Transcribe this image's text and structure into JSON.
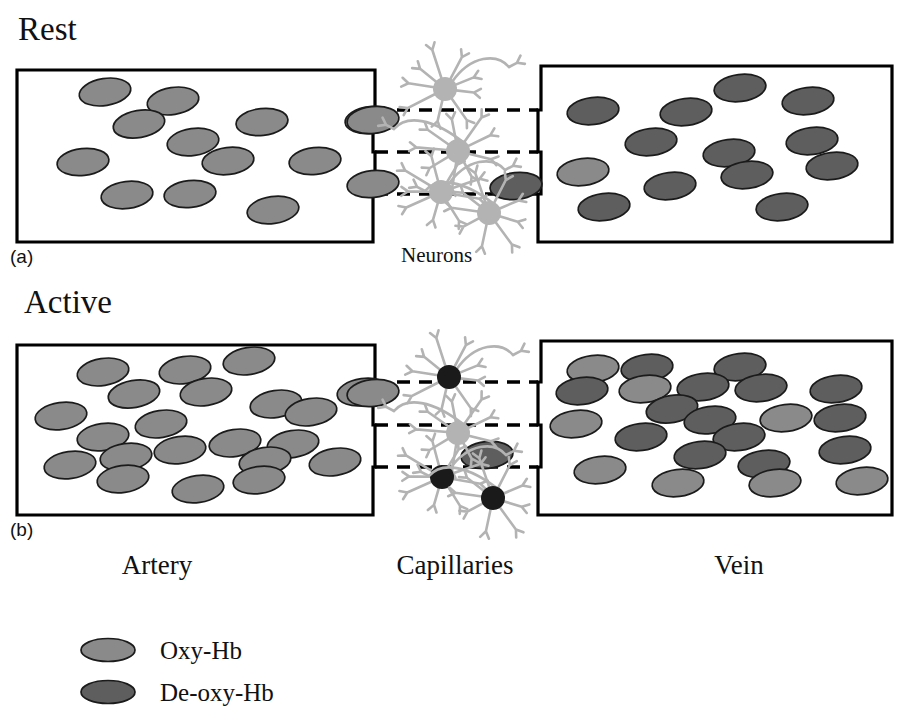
{
  "figure": {
    "title_rest": "Rest",
    "title_active": "Active",
    "sublabel_a": "(a)",
    "sublabel_b": "(b)",
    "neurons_label": "Neurons",
    "column_labels": [
      "Artery",
      "Capillaries",
      "Vein"
    ],
    "colors": {
      "oxy_hb": "#8a8a8a",
      "deoxy_hb": "#5e5e5e",
      "neuron_inactive": "#b3b3b3",
      "neuron_active": "#1a1a1a",
      "vessel_stroke": "#000000",
      "background": "#ffffff",
      "rbc_stroke": "#1b1b1b"
    }
  },
  "legend": {
    "items": [
      {
        "label": "Oxy-Hb",
        "color": "#8a8a8a"
      },
      {
        "label": "De-oxy-Hb",
        "color": "#5e5e5e"
      }
    ]
  },
  "chart_data": {
    "type": "diagram",
    "panels": [
      {
        "id": "a",
        "state": "Rest",
        "counts": {
          "artery_oxy": 12,
          "artery_deoxy": 0,
          "vein_oxy": 2,
          "vein_deoxy": 11,
          "capillary_oxy": 2,
          "capillary_deoxy": 1,
          "neurons_active": 0,
          "neurons_total": 4
        }
      },
      {
        "id": "b",
        "state": "Active",
        "counts": {
          "artery_oxy": 21,
          "artery_deoxy": 0,
          "vein_oxy": 8,
          "vein_deoxy": 14,
          "capillary_oxy": 1,
          "capillary_deoxy": 1,
          "neurons_active": 3,
          "neurons_total": 4
        }
      }
    ],
    "geometry": {
      "rbc_rx": 26,
      "rbc_ry": 13.5,
      "artery_box": {
        "x": 17,
        "y": 70,
        "w": 356,
        "h": 172
      },
      "vein_box": {
        "x": 541,
        "y": 66,
        "w": 351,
        "h": 176
      },
      "capillary_rows": [
        110,
        152,
        194
      ]
    },
    "rest": {
      "artery": [
        {
          "cx": 105,
          "cy": 92,
          "rot": -9,
          "type": "oxy"
        },
        {
          "cx": 173,
          "cy": 101,
          "rot": -9,
          "type": "oxy"
        },
        {
          "cx": 139,
          "cy": 124,
          "rot": -10,
          "type": "oxy"
        },
        {
          "cx": 262,
          "cy": 122,
          "rot": -6,
          "type": "oxy"
        },
        {
          "cx": 193,
          "cy": 142,
          "rot": -8,
          "type": "oxy"
        },
        {
          "cx": 83,
          "cy": 162,
          "rot": -6,
          "type": "oxy"
        },
        {
          "cx": 228,
          "cy": 161,
          "rot": -7,
          "type": "oxy"
        },
        {
          "cx": 315,
          "cy": 161,
          "rot": -6,
          "type": "oxy"
        },
        {
          "cx": 127,
          "cy": 195,
          "rot": -7,
          "type": "oxy"
        },
        {
          "cx": 190,
          "cy": 194,
          "rot": -6,
          "type": "oxy"
        },
        {
          "cx": 273,
          "cy": 210,
          "rot": -8,
          "type": "oxy"
        },
        {
          "cx": 371,
          "cy": 120,
          "rot": -6,
          "type": "oxy"
        }
      ],
      "capillary": [
        {
          "cx": 373,
          "cy": 120,
          "rot": -6,
          "type": "oxy"
        },
        {
          "cx": 373,
          "cy": 184,
          "rot": -6,
          "type": "oxy"
        },
        {
          "cx": 516,
          "cy": 186,
          "rot": -6,
          "type": "deoxy"
        }
      ],
      "vein": [
        {
          "cx": 740,
          "cy": 88,
          "rot": -7,
          "type": "deoxy"
        },
        {
          "cx": 593,
          "cy": 111,
          "rot": -7,
          "type": "deoxy"
        },
        {
          "cx": 686,
          "cy": 112,
          "rot": -7,
          "type": "deoxy"
        },
        {
          "cx": 808,
          "cy": 101,
          "rot": -7,
          "type": "deoxy"
        },
        {
          "cx": 651,
          "cy": 142,
          "rot": -7,
          "type": "deoxy"
        },
        {
          "cx": 812,
          "cy": 141,
          "rot": -7,
          "type": "deoxy"
        },
        {
          "cx": 729,
          "cy": 153,
          "rot": -7,
          "type": "deoxy"
        },
        {
          "cx": 583,
          "cy": 172,
          "rot": -7,
          "type": "oxy"
        },
        {
          "cx": 832,
          "cy": 166,
          "rot": -7,
          "type": "deoxy"
        },
        {
          "cx": 747,
          "cy": 175,
          "rot": -7,
          "type": "deoxy"
        },
        {
          "cx": 670,
          "cy": 186,
          "rot": -7,
          "type": "deoxy"
        },
        {
          "cx": 604,
          "cy": 207,
          "rot": -7,
          "type": "deoxy"
        },
        {
          "cx": 782,
          "cy": 207,
          "rot": -7,
          "type": "deoxy"
        }
      ],
      "neurons": [
        {
          "cx": 445,
          "cy": 89,
          "r": 12,
          "state": "inactive"
        },
        {
          "cx": 458,
          "cy": 151,
          "r": 12,
          "state": "inactive"
        },
        {
          "cx": 441,
          "cy": 192,
          "r": 12,
          "state": "inactive"
        },
        {
          "cx": 489,
          "cy": 213,
          "r": 12,
          "state": "inactive"
        }
      ]
    },
    "active": {
      "artery": [
        {
          "cx": 103,
          "cy": 372,
          "rot": -9,
          "type": "oxy"
        },
        {
          "cx": 185,
          "cy": 370,
          "rot": -9,
          "type": "oxy"
        },
        {
          "cx": 249,
          "cy": 361,
          "rot": -9,
          "type": "oxy"
        },
        {
          "cx": 134,
          "cy": 394,
          "rot": -10,
          "type": "oxy"
        },
        {
          "cx": 206,
          "cy": 392,
          "rot": -9,
          "type": "oxy"
        },
        {
          "cx": 276,
          "cy": 404,
          "rot": -9,
          "type": "oxy"
        },
        {
          "cx": 61,
          "cy": 416,
          "rot": -8,
          "type": "oxy"
        },
        {
          "cx": 311,
          "cy": 412,
          "rot": -9,
          "type": "oxy"
        },
        {
          "cx": 161,
          "cy": 424,
          "rot": -9,
          "type": "oxy"
        },
        {
          "cx": 363,
          "cy": 392,
          "rot": -8,
          "type": "oxy"
        },
        {
          "cx": 103,
          "cy": 437,
          "rot": -8,
          "type": "oxy"
        },
        {
          "cx": 235,
          "cy": 443,
          "rot": -9,
          "type": "oxy"
        },
        {
          "cx": 180,
          "cy": 450,
          "rot": -8,
          "type": "oxy"
        },
        {
          "cx": 293,
          "cy": 444,
          "rot": -9,
          "type": "oxy"
        },
        {
          "cx": 126,
          "cy": 457,
          "rot": -8,
          "type": "oxy"
        },
        {
          "cx": 70,
          "cy": 465,
          "rot": -8,
          "type": "oxy"
        },
        {
          "cx": 265,
          "cy": 461,
          "rot": -9,
          "type": "oxy"
        },
        {
          "cx": 335,
          "cy": 462,
          "rot": -9,
          "type": "oxy"
        },
        {
          "cx": 123,
          "cy": 479,
          "rot": -8,
          "type": "oxy"
        },
        {
          "cx": 198,
          "cy": 489,
          "rot": -8,
          "type": "oxy"
        },
        {
          "cx": 259,
          "cy": 480,
          "rot": -8,
          "type": "oxy"
        }
      ],
      "capillary": [
        {
          "cx": 373,
          "cy": 393,
          "rot": -6,
          "type": "oxy"
        },
        {
          "cx": 487,
          "cy": 455,
          "rot": -6,
          "type": "deoxy"
        }
      ],
      "vein": [
        {
          "cx": 593,
          "cy": 369,
          "rot": -7,
          "type": "oxy"
        },
        {
          "cx": 647,
          "cy": 368,
          "rot": -7,
          "type": "deoxy"
        },
        {
          "cx": 740,
          "cy": 367,
          "rot": -7,
          "type": "deoxy"
        },
        {
          "cx": 645,
          "cy": 389,
          "rot": -7,
          "type": "oxy"
        },
        {
          "cx": 703,
          "cy": 387,
          "rot": -7,
          "type": "deoxy"
        },
        {
          "cx": 761,
          "cy": 388,
          "rot": -7,
          "type": "deoxy"
        },
        {
          "cx": 836,
          "cy": 389,
          "rot": -7,
          "type": "deoxy"
        },
        {
          "cx": 582,
          "cy": 391,
          "rot": -7,
          "type": "deoxy"
        },
        {
          "cx": 672,
          "cy": 409,
          "rot": -10,
          "type": "deoxy"
        },
        {
          "cx": 710,
          "cy": 420,
          "rot": -8,
          "type": "deoxy"
        },
        {
          "cx": 576,
          "cy": 424,
          "rot": -7,
          "type": "oxy"
        },
        {
          "cx": 786,
          "cy": 418,
          "rot": -7,
          "type": "oxy"
        },
        {
          "cx": 840,
          "cy": 418,
          "rot": -7,
          "type": "deoxy"
        },
        {
          "cx": 641,
          "cy": 437,
          "rot": -7,
          "type": "deoxy"
        },
        {
          "cx": 739,
          "cy": 437,
          "rot": -7,
          "type": "deoxy"
        },
        {
          "cx": 700,
          "cy": 455,
          "rot": -7,
          "type": "deoxy"
        },
        {
          "cx": 845,
          "cy": 450,
          "rot": -7,
          "type": "deoxy"
        },
        {
          "cx": 764,
          "cy": 464,
          "rot": -7,
          "type": "deoxy"
        },
        {
          "cx": 600,
          "cy": 470,
          "rot": -7,
          "type": "oxy"
        },
        {
          "cx": 678,
          "cy": 483,
          "rot": -7,
          "type": "oxy"
        },
        {
          "cx": 775,
          "cy": 483,
          "rot": -7,
          "type": "oxy"
        },
        {
          "cx": 862,
          "cy": 481,
          "rot": -7,
          "type": "oxy"
        }
      ],
      "neurons": [
        {
          "cx": 449,
          "cy": 377,
          "r": 12,
          "state": "active"
        },
        {
          "cx": 458,
          "cy": 433,
          "r": 12,
          "state": "inactive"
        },
        {
          "cx": 442,
          "cy": 477,
          "r": 12,
          "state": "active"
        },
        {
          "cx": 493,
          "cy": 498,
          "r": 12,
          "state": "active"
        }
      ]
    }
  }
}
